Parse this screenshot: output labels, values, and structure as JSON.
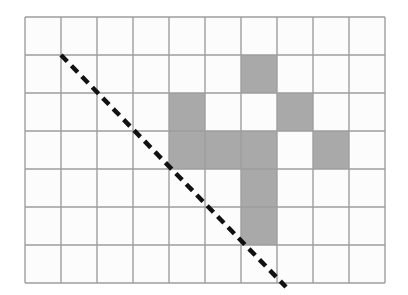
{
  "figure": {
    "background_color": "#ffffff"
  },
  "grid": {
    "columns": 10,
    "rows": 7,
    "origin_x": 25,
    "origin_y": 17,
    "cell_width": 36,
    "cell_height": 38,
    "line_color": "#9e9e9e",
    "line_width": 1.4,
    "cell_fill_color": "#fcfcfc"
  },
  "shaded_cells": {
    "fill_color": "#a9a9a9",
    "count": 9,
    "cells": [
      {
        "col": 6,
        "row": 1
      },
      {
        "col": 4,
        "row": 2
      },
      {
        "col": 7,
        "row": 2
      },
      {
        "col": 4,
        "row": 3
      },
      {
        "col": 5,
        "row": 3
      },
      {
        "col": 6,
        "row": 3
      },
      {
        "col": 8,
        "row": 3
      },
      {
        "col": 6,
        "row": 4
      },
      {
        "col": 6,
        "row": 5
      }
    ]
  },
  "dashed_line": {
    "color": "#111111",
    "width": 4.5,
    "dash_length": 9,
    "gap_length": 6,
    "x1": 61,
    "y1": 55,
    "x2": 286,
    "y2": 287
  }
}
